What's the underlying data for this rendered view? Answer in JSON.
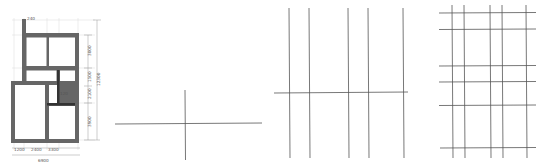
{
  "panels": [
    {
      "id": "floor-plan",
      "description": "Architectural floor plan with wall thickness and dimensions",
      "dimensions": {
        "wall_thickness_top": "240",
        "inner_wall": "120",
        "right_top": "3000",
        "right_mid1": "1500",
        "right_mid2": "2100",
        "right_bottom": "3900",
        "right_total": "12300",
        "bottom_left": "1200",
        "bottom_mid": "2400",
        "bottom_right": "3300",
        "bottom_total": "6900"
      }
    },
    {
      "id": "step-1-axes",
      "description": "Single horizontal and vertical axis line"
    },
    {
      "id": "step-2-axes",
      "description": "Five vertical axis lines with one horizontal line"
    },
    {
      "id": "step-3-grid",
      "description": "Full axis grid: five vertical and six horizontal lines"
    }
  ],
  "colors": {
    "wall": "#666666",
    "axis": "#555555",
    "guide": "#d8d8d8"
  }
}
